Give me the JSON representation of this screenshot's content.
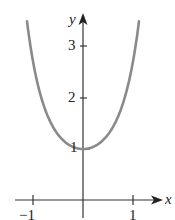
{
  "chart_data": {
    "type": "line",
    "title": "",
    "function": "y = e^(x^2)",
    "xlabel": "x",
    "ylabel": "y",
    "xlim": [
      -1.14,
      1.14
    ],
    "ylim": [
      0,
      3.7
    ],
    "x_ticks": [
      -1,
      1
    ],
    "y_ticks": [
      1,
      2,
      3
    ],
    "grid": false,
    "legend": null,
    "series": [
      {
        "name": "curve",
        "color": "#8a8a8a",
        "x": [
          -1.12,
          -1.0,
          -0.8,
          -0.6,
          -0.4,
          -0.2,
          0,
          0.2,
          0.4,
          0.6,
          0.8,
          1.0,
          1.12
        ],
        "y": [
          3.51,
          2.72,
          1.9,
          1.43,
          1.17,
          1.04,
          1.0,
          1.04,
          1.17,
          1.43,
          1.9,
          2.72,
          3.51
        ]
      }
    ]
  },
  "labels": {
    "x_axis": "x",
    "y_axis": "y",
    "tick_x_neg1": "−1",
    "tick_x_1": "1",
    "tick_y_1": "1",
    "tick_y_2": "2",
    "tick_y_3": "3"
  },
  "colors": {
    "axis": "#333333",
    "curve": "#8a8a8a"
  }
}
